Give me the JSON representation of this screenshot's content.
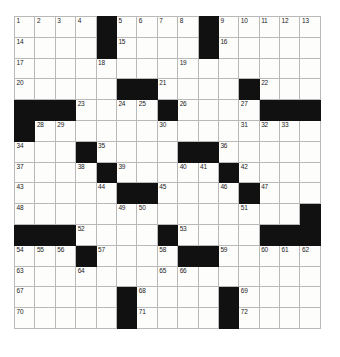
{
  "puzzle": {
    "type": "crossword-grid",
    "rows": 15,
    "cols": 15,
    "cell_color": "#fdfdfc",
    "block_color": "#111111",
    "grid_line_color": "#b9b9b9",
    "number_color": "#1b1b1b",
    "max_clue_number": 72,
    "grid": [
      [
        "1",
        "2",
        "3",
        "4",
        "#",
        "5",
        "6",
        "7",
        "8",
        "#",
        "9",
        "10",
        "11",
        "12",
        "13"
      ],
      [
        "14",
        "",
        "",
        "",
        "#",
        "15",
        "",
        "",
        "",
        "#",
        "16",
        "",
        "",
        "",
        ""
      ],
      [
        "17",
        "",
        "",
        "",
        "18",
        "",
        "",
        "",
        "19",
        "",
        "",
        "",
        "",
        "",
        ""
      ],
      [
        "20",
        "",
        "",
        "",
        "",
        "#",
        "#",
        "21",
        "",
        "",
        "",
        "#",
        "22",
        "",
        ""
      ],
      [
        "#",
        "#",
        "#",
        "23",
        "",
        "24",
        "25",
        "#",
        "26",
        "",
        "",
        "27",
        "#",
        "#",
        "#"
      ],
      [
        "#",
        "28",
        "29",
        "",
        "",
        "",
        "",
        "30",
        "",
        "",
        "",
        "31",
        "32",
        "33",
        ""
      ],
      [
        "34",
        "",
        "",
        "#",
        "35",
        "",
        "",
        "",
        "#",
        "#",
        "36",
        "",
        "",
        "",
        ""
      ],
      [
        "37",
        "",
        "",
        "38",
        "#",
        "39",
        "",
        "",
        "40",
        "41",
        "#",
        "42",
        "",
        "",
        ""
      ],
      [
        "43",
        "",
        "",
        "",
        "44",
        "#",
        "#",
        "45",
        "",
        "",
        "46",
        "#",
        "47",
        "",
        ""
      ],
      [
        "48",
        "",
        "",
        "",
        "",
        "49",
        "50",
        "",
        "",
        "",
        "",
        "51",
        "",
        "",
        "#"
      ],
      [
        "#",
        "#",
        "#",
        "52",
        "",
        "",
        "",
        "#",
        "53",
        "",
        "",
        "",
        "#",
        "#",
        "#"
      ],
      [
        "54",
        "55",
        "56",
        "#",
        "57",
        "",
        "",
        "58",
        "#",
        "#",
        "59",
        "",
        "60",
        "61",
        "62"
      ],
      [
        "63",
        "",
        "",
        "64",
        "",
        "",
        "",
        "65",
        "66",
        "",
        "",
        "",
        "",
        "",
        ""
      ],
      [
        "67",
        "",
        "",
        "",
        "",
        "#",
        "68",
        "",
        "",
        "",
        "#",
        "69",
        "",
        "",
        ""
      ],
      [
        "70",
        "",
        "",
        "",
        "",
        "#",
        "71",
        "",
        "",
        "",
        "#",
        "72",
        "",
        "",
        ""
      ]
    ]
  }
}
